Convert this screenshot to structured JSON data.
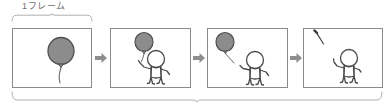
{
  "diagram": {
    "title_label": "1フレーム",
    "colors": {
      "balloon_fill": "#8c8c8c",
      "balloon_stroke": "#4f4f4f",
      "panel_border": "#8a8a8a",
      "figure_stroke": "#4a4a4a",
      "arrow_fill": "#8e8e8e",
      "bracket_stroke": "#b0b0b0",
      "label_text": "#6e6e6e",
      "background": "#ffffff"
    },
    "top_bracket": {
      "name": "one-frame-bracket",
      "spans_panels": 1
    },
    "bottom_bracket": {
      "name": "full-sequence-bracket",
      "spans_panels": 4,
      "label": ""
    },
    "arrows": [
      {
        "name": "arrow-1-to-2",
        "glyph": "right-arrow"
      },
      {
        "name": "arrow-2-to-3",
        "glyph": "right-arrow"
      },
      {
        "name": "arrow-3-to-4",
        "glyph": "right-arrow"
      }
    ],
    "panels": [
      {
        "index": 1,
        "name": "panel-balloon-only",
        "description": "Large gray balloon with hanging string, no figure",
        "has_balloon": true,
        "has_figure": false,
        "caption": ""
      },
      {
        "index": 2,
        "name": "panel-figure-holding-balloon",
        "description": "Stick figure holding balloon string with raised arm",
        "has_balloon": true,
        "has_figure": true,
        "caption": ""
      },
      {
        "index": 3,
        "name": "panel-balloon-released",
        "description": "Balloon drifting away at upper left, figure with arms raised",
        "has_balloon": true,
        "has_figure": true,
        "caption": ""
      },
      {
        "index": 4,
        "name": "panel-balloon-gone",
        "description": "Only string tail visible at top left, figure reaching up",
        "has_balloon": false,
        "has_figure": true,
        "caption": ""
      }
    ]
  }
}
